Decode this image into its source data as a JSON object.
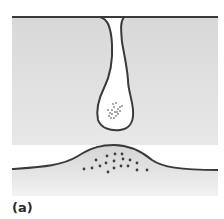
{
  "figure": {
    "panel_label": "(a)",
    "colors": {
      "background": "#ffffff",
      "cytoplasm_fill": "#dcdcdc",
      "outline": "#3a3a3a",
      "vesicle_fill": "#ffffff",
      "dot": "#404040"
    },
    "elements": [
      {
        "name": "upper-cell",
        "description": "upper gray region with membrane line"
      },
      {
        "name": "vesicle-invagination",
        "description": "narrow neck leading to rounded vesicle containing dotted contents"
      },
      {
        "name": "lower-mound",
        "description": "lower gray region with raised mound containing scattered dots"
      }
    ]
  }
}
